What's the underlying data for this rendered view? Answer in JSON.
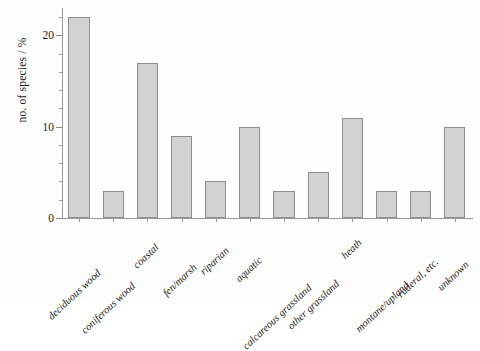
{
  "chart_data": {
    "type": "bar",
    "title": "",
    "xlabel": "",
    "ylabel": "no. of species / %",
    "ylim": [
      0,
      23
    ],
    "yticks": [
      0,
      10,
      20
    ],
    "ytick_labels": [
      "0",
      "10",
      "20"
    ],
    "yminor_step": 2,
    "grid": false,
    "legend": null,
    "categories": [
      "deciduous wood",
      "coniferous wood",
      "coastal",
      "fen/marsh",
      "riparian",
      "aquatic",
      "calcareous grassland",
      "other grassland",
      "heath",
      "montane/upland",
      "ruderal, etc.",
      "unknown"
    ],
    "values": [
      22,
      3,
      17,
      9,
      4,
      10,
      3,
      5,
      11,
      3,
      3,
      10
    ],
    "bar_color": "#d2d2d2",
    "bar_edge_color": "#8e8e8e",
    "axis_color": "#9a9a9a",
    "background": "#fdfdfd"
  }
}
